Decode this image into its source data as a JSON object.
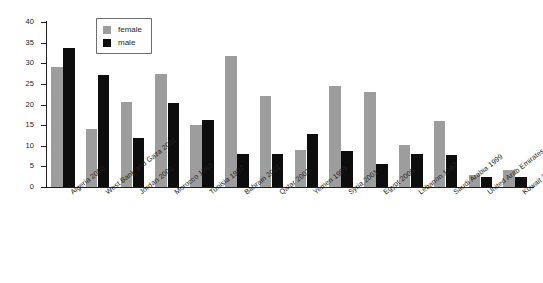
{
  "chart_data": {
    "type": "bar",
    "title": "",
    "xlabel": "",
    "ylabel": "percent",
    "ylim": [
      0,
      40
    ],
    "yticks": [
      0,
      5,
      10,
      15,
      20,
      25,
      30,
      35,
      40
    ],
    "grid": false,
    "legend_position": "top-left-inside",
    "categories": [
      "Algeria 2000",
      "West Bank and Gaza 2001",
      "Jordan 2000",
      "Morocco 1999",
      "Tunisia 1997",
      "Bahrain 2001",
      "Qatar 2002",
      "Yemen 1999",
      "Syria 2001",
      "Egypt 2000",
      "Lebanon 1997",
      "Saudi Arabia 1999",
      "United Arab Emirates 1999",
      "Kuwait 2003"
    ],
    "series": [
      {
        "name": "female",
        "color": "#9d9d9d",
        "values": [
          29.1,
          14.1,
          20.6,
          27.5,
          15.1,
          31.8,
          22.0,
          9.0,
          24.4,
          23.0,
          10.1,
          16.1,
          3.0,
          4.1
        ]
      },
      {
        "name": "male",
        "color": "#0d0d0d",
        "values": [
          33.6,
          27.1,
          11.8,
          20.4,
          16.2,
          8.0,
          7.9,
          12.9,
          8.8,
          5.6,
          8.0,
          7.8,
          2.4,
          2.5
        ]
      }
    ]
  },
  "legend": {
    "items": [
      {
        "label": "female",
        "color": "#9d9d9d"
      },
      {
        "label": "male",
        "color": "#0d0d0d"
      }
    ]
  },
  "axis": {
    "y_title": "percent"
  }
}
